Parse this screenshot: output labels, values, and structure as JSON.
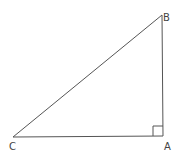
{
  "diagram": {
    "type": "right-triangle",
    "vertices": {
      "A": {
        "label": "A",
        "x": 163,
        "y": 136
      },
      "B": {
        "label": "B",
        "x": 162,
        "y": 15
      },
      "C": {
        "label": "C",
        "x": 13,
        "y": 137
      }
    },
    "right_angle_at": "A",
    "line_color": "#555555"
  }
}
